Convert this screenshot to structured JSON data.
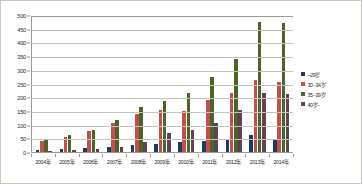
{
  "chart_data": {
    "type": "bar",
    "title": "",
    "xlabel": "",
    "ylabel": "",
    "ylim": [
      0,
      500
    ],
    "ytick_step": 50,
    "yticks": [
      "0",
      "50",
      "100",
      "150",
      "200",
      "250",
      "300",
      "350",
      "400",
      "450",
      "500"
    ],
    "grid": true,
    "legend_position": "right",
    "categories": [
      "2004年",
      "2005年",
      "2006年",
      "2007年",
      "2008年",
      "2009年",
      "2010年",
      "2011年",
      "2012年",
      "2013年",
      "2014年"
    ],
    "series": [
      {
        "name": "~29岁",
        "color": "#1f3864",
        "values": [
          8,
          10,
          13,
          18,
          25,
          30,
          35,
          40,
          45,
          62,
          45
        ]
      },
      {
        "name": "30−34岁",
        "color": "#c0504d",
        "values": [
          42,
          55,
          78,
          105,
          140,
          155,
          150,
          190,
          215,
          262,
          255
        ]
      },
      {
        "name": "35−39岁",
        "color": "#4f6228",
        "values": [
          45,
          62,
          80,
          118,
          165,
          185,
          215,
          275,
          340,
          475,
          472
        ]
      },
      {
        "name": "40岁−",
        "color": "#5f4350",
        "values": [
          5,
          7,
          10,
          18,
          35,
          70,
          82,
          105,
          152,
          215,
          212
        ]
      }
    ]
  },
  "legend": {
    "items": [
      {
        "label": "~29岁",
        "color": "#1f3864"
      },
      {
        "label": "30−34岁",
        "color": "#c0504d"
      },
      {
        "label": "35−39岁",
        "color": "#4f6228"
      },
      {
        "label": "40岁−",
        "color": "#5f4350"
      }
    ]
  }
}
